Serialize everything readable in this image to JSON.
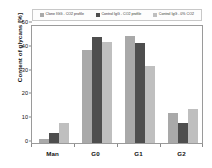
{
  "chart_data": {
    "type": "bar",
    "title": "",
    "xlabel": "",
    "ylabel": "Content of glycans [%]",
    "categories": [
      "Man",
      "G0",
      "G1",
      "G2"
    ],
    "ylim": [
      0,
      50
    ],
    "yticks": [
      0,
      10,
      20,
      30,
      40,
      50
    ],
    "grid": false,
    "legend_position": "top",
    "series": [
      {
        "name": "Clone IGG - CO2 profile",
        "color": "#a9a9a9",
        "values": [
          1.5,
          39.0,
          45.0,
          12.5
        ]
      },
      {
        "name": "Control IgG - CO2 profile",
        "color": "#4e4e4e",
        "values": [
          4.0,
          44.5,
          42.0,
          8.5
        ]
      },
      {
        "name": "Control IgG - 0% CO2",
        "color": "#bfbfbf",
        "values": [
          8.5,
          42.5,
          32.5,
          14.5
        ]
      }
    ]
  },
  "axes": {
    "y_title": "Content of glycans [%]",
    "y_tick_labels": [
      "0",
      "10",
      "20",
      "30",
      "40",
      "50"
    ],
    "x_tick_labels": [
      "Man",
      "G0",
      "G1",
      "G2"
    ]
  },
  "legend": {
    "entries": [
      {
        "label": "Clone IGG - CO2 profile",
        "swatch": "series-0-swatch"
      },
      {
        "label": "Control IgG - CO2 profile",
        "swatch": "series-1-swatch"
      },
      {
        "label": "Control IgG - 0% CO2",
        "swatch": "series-2-swatch"
      }
    ]
  }
}
